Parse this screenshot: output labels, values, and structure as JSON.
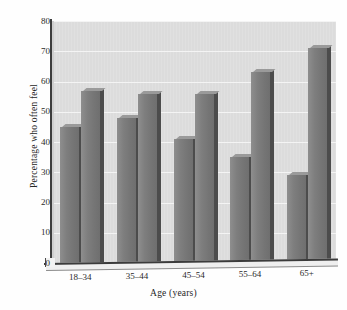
{
  "chart_data": {
    "type": "bar",
    "title": "",
    "subtitle": "",
    "xlabel": "Age (years)",
    "ylabel": "Percentage who often feel",
    "categories": [
      "18–34",
      "35–44",
      "45–54",
      "55–64",
      "65+"
    ],
    "series": [
      {
        "name": "Series 1",
        "values": [
          45,
          48,
          41,
          35,
          29
        ]
      },
      {
        "name": "Series 2",
        "values": [
          57,
          56,
          56,
          63,
          71
        ]
      }
    ],
    "ylim": [
      0,
      80
    ],
    "yticks": [
      0,
      10,
      20,
      30,
      40,
      50,
      60,
      70,
      80
    ],
    "ytick_labels": [
      "0",
      "10",
      "20",
      "30",
      "40",
      "50",
      "60",
      "70",
      "80"
    ],
    "grid": true,
    "grid_axis": "y",
    "legend": false,
    "legend_position": "none",
    "style": "3d-bar",
    "colors": {
      "panel_background": "#dcdcdc",
      "gridline": "#f4f4f4",
      "bar_front": "#7e7e7e",
      "bar_side": "#4c4c4c",
      "bar_top": "#9a9a9a",
      "axis": "#3b3b3b",
      "text": "#2a2a2a",
      "page_background": "#ffffff"
    }
  }
}
